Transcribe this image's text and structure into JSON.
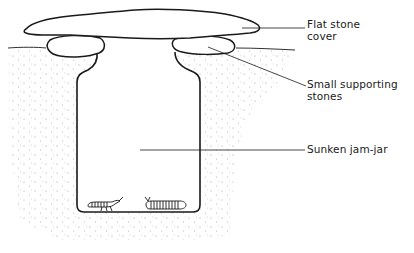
{
  "diagram": {
    "labels": {
      "flat_stone": {
        "line1": "Flat stone",
        "line2": "cover"
      },
      "supporting_stones": {
        "line1": "Small supporting",
        "line2": "stones"
      },
      "jar": {
        "line1": "Sunken jam-jar"
      }
    },
    "components": [
      "flat-stone-cover",
      "left-supporting-stone",
      "right-supporting-stone",
      "ground-surface",
      "soil-stipple",
      "sunken-jam-jar",
      "beetle-larva-left",
      "millipede-right"
    ],
    "colors": {
      "ink": "#1a1a1a",
      "stipple": "#8a8a8a",
      "background": "#ffffff"
    }
  }
}
